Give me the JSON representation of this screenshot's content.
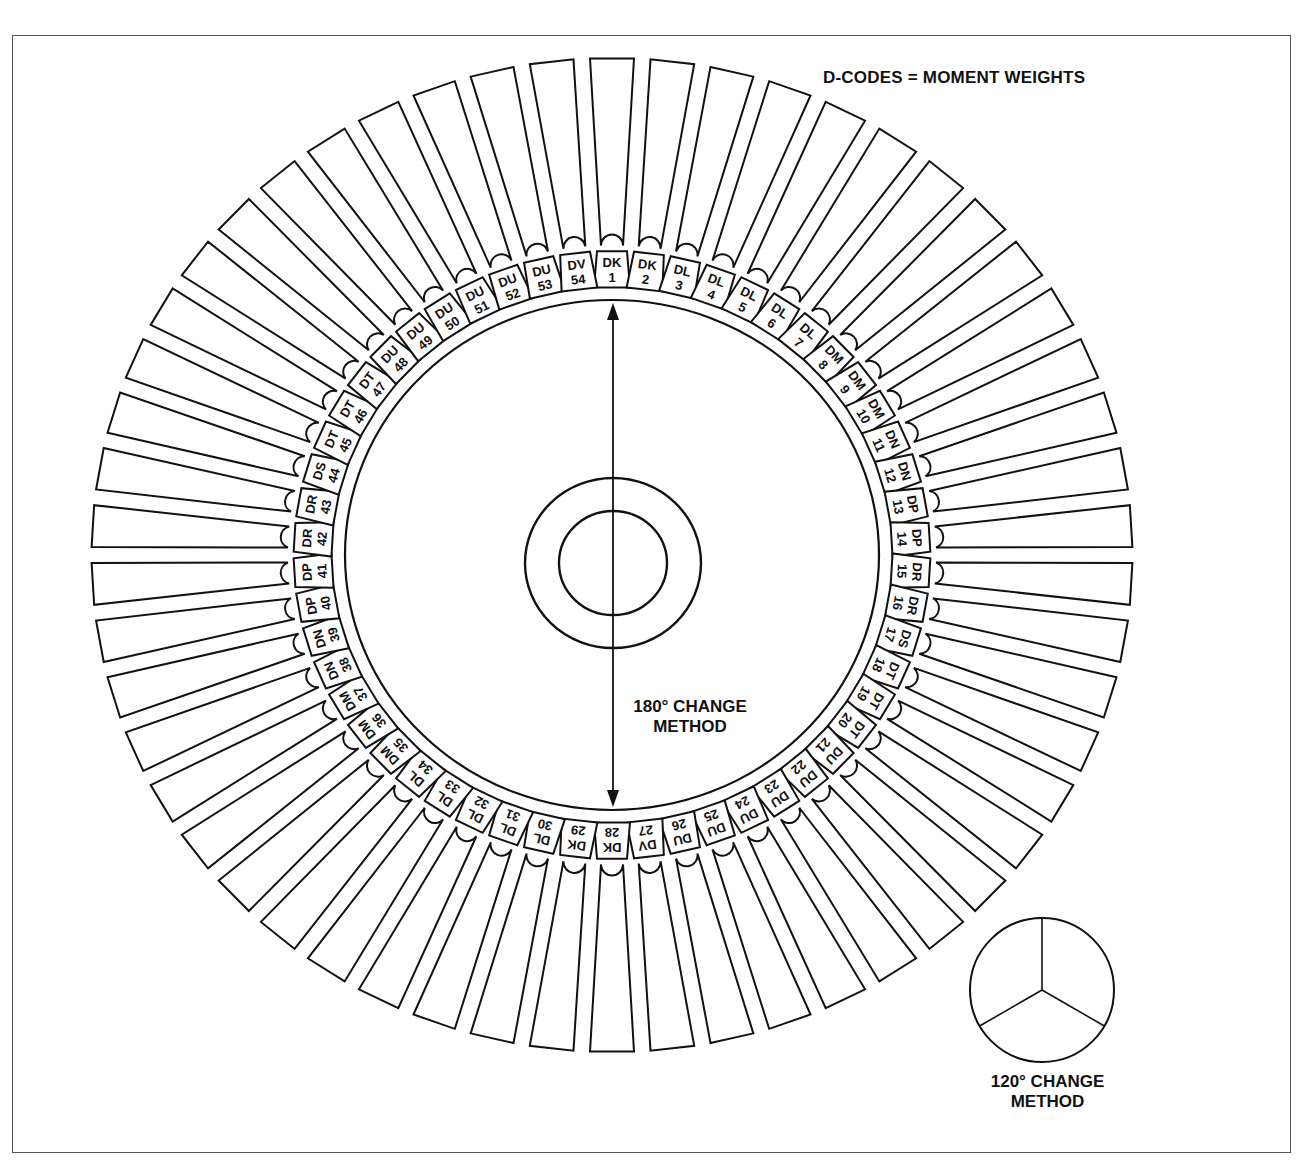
{
  "diagram": {
    "title": "D-CODES = MOMENT WEIGHTS",
    "center_method": {
      "line1": "180° CHANGE",
      "line2": "METHOD"
    },
    "inset_method": {
      "line1": "120° CHANGE",
      "line2": "METHOD"
    },
    "caption": "",
    "blade_count": 54,
    "blades": [
      {
        "n": 1,
        "code": "DK"
      },
      {
        "n": 2,
        "code": "DK"
      },
      {
        "n": 3,
        "code": "DL"
      },
      {
        "n": 4,
        "code": "DL"
      },
      {
        "n": 5,
        "code": "DL"
      },
      {
        "n": 6,
        "code": "DL"
      },
      {
        "n": 7,
        "code": "DL"
      },
      {
        "n": 8,
        "code": "DM"
      },
      {
        "n": 9,
        "code": "DM"
      },
      {
        "n": 10,
        "code": "DM"
      },
      {
        "n": 11,
        "code": "DN"
      },
      {
        "n": 12,
        "code": "DN"
      },
      {
        "n": 13,
        "code": "DP"
      },
      {
        "n": 14,
        "code": "DP"
      },
      {
        "n": 15,
        "code": "DR"
      },
      {
        "n": 16,
        "code": "DR"
      },
      {
        "n": 17,
        "code": "DS"
      },
      {
        "n": 18,
        "code": "DT"
      },
      {
        "n": 19,
        "code": "DT"
      },
      {
        "n": 20,
        "code": "DT"
      },
      {
        "n": 21,
        "code": "DU"
      },
      {
        "n": 22,
        "code": "DU"
      },
      {
        "n": 23,
        "code": "DU"
      },
      {
        "n": 24,
        "code": "DU"
      },
      {
        "n": 25,
        "code": "DU"
      },
      {
        "n": 26,
        "code": "DU"
      },
      {
        "n": 27,
        "code": "DV"
      },
      {
        "n": 28,
        "code": "DK"
      },
      {
        "n": 29,
        "code": "DK"
      },
      {
        "n": 30,
        "code": "DL"
      },
      {
        "n": 31,
        "code": "DL"
      },
      {
        "n": 32,
        "code": "DL"
      },
      {
        "n": 33,
        "code": "DL"
      },
      {
        "n": 34,
        "code": "DL"
      },
      {
        "n": 35,
        "code": "DM"
      },
      {
        "n": 36,
        "code": "DM"
      },
      {
        "n": 37,
        "code": "DM"
      },
      {
        "n": 38,
        "code": "DN"
      },
      {
        "n": 39,
        "code": "DN"
      },
      {
        "n": 40,
        "code": "DP"
      },
      {
        "n": 41,
        "code": "DP"
      },
      {
        "n": 42,
        "code": "DR"
      },
      {
        "n": 43,
        "code": "DR"
      },
      {
        "n": 44,
        "code": "DS"
      },
      {
        "n": 45,
        "code": "DT"
      },
      {
        "n": 46,
        "code": "DT"
      },
      {
        "n": 47,
        "code": "DT"
      },
      {
        "n": 48,
        "code": "DU"
      },
      {
        "n": 49,
        "code": "DU"
      },
      {
        "n": 50,
        "code": "DU"
      },
      {
        "n": 51,
        "code": "DU"
      },
      {
        "n": 52,
        "code": "DU"
      },
      {
        "n": 53,
        "code": "DU"
      },
      {
        "n": 54,
        "code": "DV"
      }
    ],
    "colors": {
      "line": "#111111",
      "background": "#ffffff",
      "frame": "#555555"
    }
  }
}
